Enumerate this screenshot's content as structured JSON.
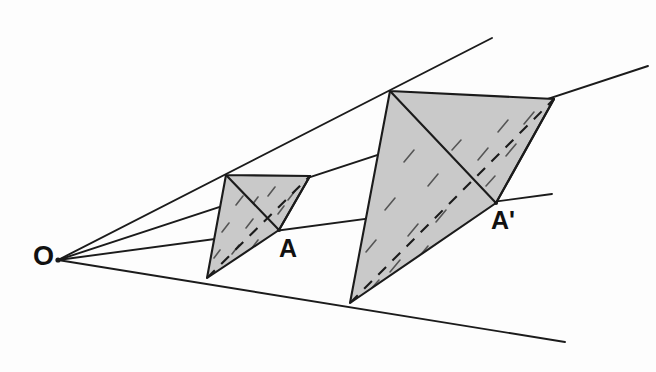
{
  "figure": {
    "type": "geometric-diagram",
    "width": 656,
    "height": 372,
    "background_color": "#fdfdfd",
    "line_color": "#1b1b1b",
    "fill_color": "#c9c9c9"
  },
  "labels": {
    "center": "O",
    "source_point": "A",
    "image_point": "A'"
  },
  "points": {
    "O": {
      "name": "O",
      "x": 58,
      "y": 260
    },
    "A": {
      "name": "A",
      "x": 279,
      "y": 230
    },
    "A_prime": {
      "name": "A'",
      "x": 496,
      "y": 203
    }
  },
  "small_tetrahedron": {
    "name": "source-tetrahedron",
    "top_left": {
      "x": 226,
      "y": 175
    },
    "top_right": {
      "x": 310,
      "y": 176
    },
    "front": {
      "x": 279,
      "y": 230
    },
    "bottom": {
      "x": 207,
      "y": 278
    },
    "hidden_edge": {
      "from": "bottom",
      "to": "top_right"
    }
  },
  "large_tetrahedron": {
    "name": "image-tetrahedron",
    "top_left": {
      "x": 390,
      "y": 91
    },
    "top_right": {
      "x": 554,
      "y": 99
    },
    "front": {
      "x": 496,
      "y": 203
    },
    "bottom": {
      "x": 350,
      "y": 303
    },
    "hidden_edge": {
      "from": "bottom",
      "to": "top_right"
    }
  },
  "rays": [
    {
      "name": "ray-top-left",
      "from": {
        "x": 58,
        "y": 260
      },
      "to": {
        "x": 492,
        "y": 38
      }
    },
    {
      "name": "ray-top-right",
      "from": {
        "x": 58,
        "y": 260
      },
      "to": {
        "x": 648,
        "y": 66
      }
    },
    {
      "name": "ray-through-A",
      "from": {
        "x": 58,
        "y": 260
      },
      "to": {
        "x": 552,
        "y": 194
      }
    },
    {
      "name": "ray-bottom",
      "from": {
        "x": 58,
        "y": 260
      },
      "to": {
        "x": 565,
        "y": 342
      }
    }
  ]
}
